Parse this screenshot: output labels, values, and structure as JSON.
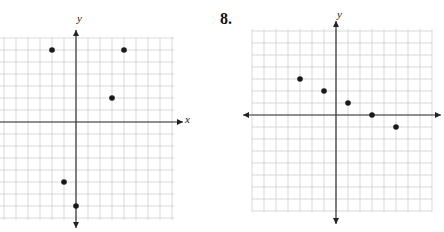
{
  "chart_data": [
    {
      "type": "scatter",
      "title": "",
      "xlabel": "x",
      "ylabel": "y",
      "grid": true,
      "xlim": [
        -8,
        9
      ],
      "ylim": [
        -8,
        8
      ],
      "points": [
        {
          "x": -2,
          "y": 6
        },
        {
          "x": 4,
          "y": 6
        },
        {
          "x": 3,
          "y": 2
        },
        {
          "x": -1,
          "y": -5
        },
        {
          "x": 0,
          "y": -7
        }
      ]
    },
    {
      "type": "scatter",
      "title": "8.",
      "xlabel": "",
      "ylabel": "y",
      "grid": true,
      "xlim": [
        -8,
        8
      ],
      "ylim": [
        -8,
        8
      ],
      "points": [
        {
          "x": -3,
          "y": 3
        },
        {
          "x": -1,
          "y": 2
        },
        {
          "x": 1,
          "y": 1
        },
        {
          "x": 3,
          "y": 0
        },
        {
          "x": 5,
          "y": -1
        }
      ]
    }
  ],
  "plot1": {
    "x_label": "x",
    "y_label": "y"
  },
  "plot2": {
    "number": "8.",
    "y_label": "y"
  }
}
